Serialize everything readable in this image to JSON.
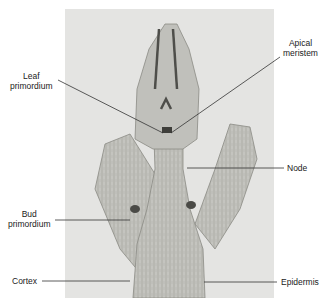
{
  "diagram": {
    "labels": {
      "leaf_primordium_1": "Leaf",
      "leaf_primordium_2": "primordium",
      "apical_meristem_1": "Apical",
      "apical_meristem_2": "meristem",
      "node": "Node",
      "bud_primordium_1": "Bud",
      "bud_primordium_2": "primordium",
      "cortex": "Cortex",
      "epidermis": "Epidermis"
    },
    "colors": {
      "background": "#ffffff",
      "photo_bg": "#e4e4e2",
      "tissue": "#b9b9b4",
      "tissue_dark": "#5a5a56",
      "leader_line": "#333333"
    }
  }
}
